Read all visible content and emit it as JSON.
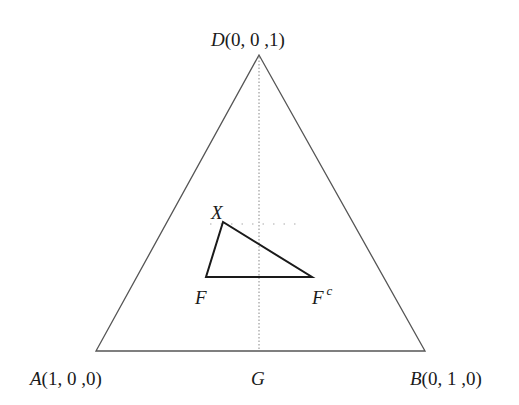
{
  "diagram": {
    "type": "ternary-simplex",
    "vertices": {
      "D": {
        "label": "D",
        "coords": "(0, 0 ,1)"
      },
      "A": {
        "label": "A",
        "coords": "(1, 0 ,0)"
      },
      "B": {
        "label": "B",
        "coords": "(0, 1 ,0)"
      }
    },
    "points": {
      "G": {
        "label": "G"
      },
      "X": {
        "label": "X"
      },
      "F": {
        "label": "F"
      },
      "Fc": {
        "label": "F",
        "superscript": "c"
      }
    },
    "lines": [
      {
        "name": "median-DG",
        "style": "dotted"
      },
      {
        "name": "horizontal-through-X",
        "style": "dotted"
      }
    ],
    "inner_triangle": [
      "X",
      "F",
      "Fc"
    ],
    "colors": {
      "stroke": "#555555",
      "inner_stroke": "#1a1a1a",
      "dotted": "#888888"
    }
  }
}
